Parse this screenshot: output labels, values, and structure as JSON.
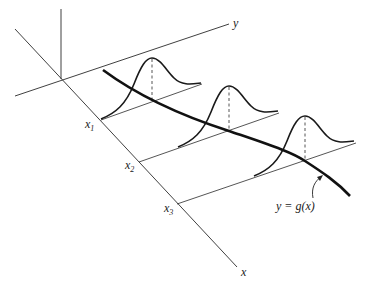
{
  "figure": {
    "axes": {
      "x_label": "x",
      "y_label": "y"
    },
    "ticks": [
      {
        "label": "x",
        "subscript": "1"
      },
      {
        "label": "x",
        "subscript": "2"
      },
      {
        "label": "x",
        "subscript": "3"
      }
    ],
    "curve_label": "y = g(x)"
  },
  "colors": {
    "ink": "#1a1a1a",
    "background": "#ffffff"
  }
}
